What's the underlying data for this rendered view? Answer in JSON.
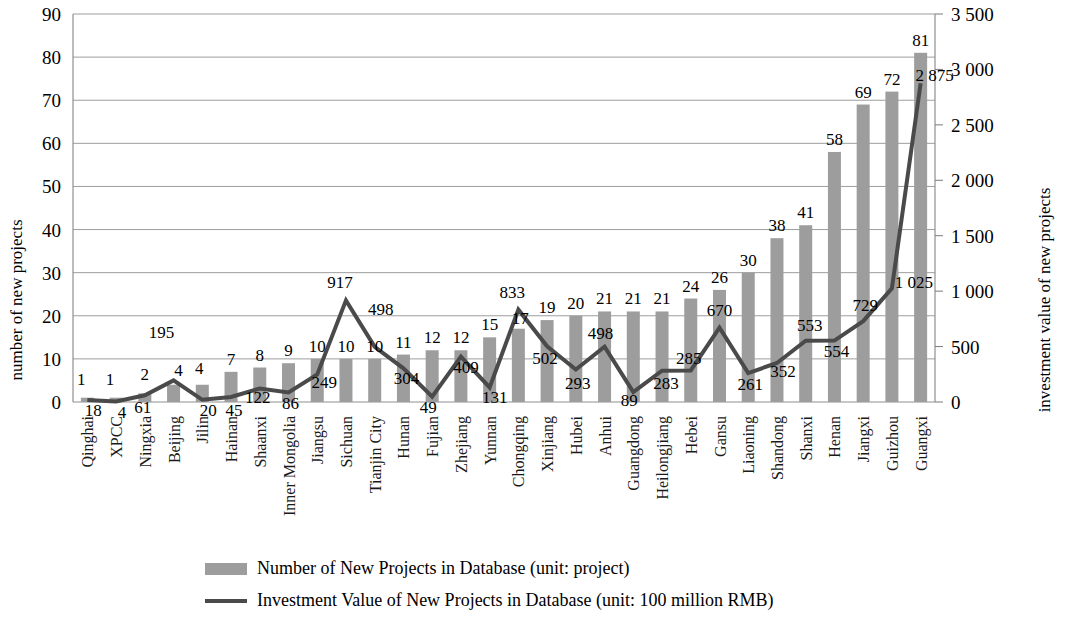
{
  "chart_data": {
    "type": "bar",
    "title": "",
    "subtitle": "",
    "xlabel": "",
    "ylabel": "number of new projects",
    "y2label": "investment value of new projects",
    "ylim": [
      0,
      90
    ],
    "y2lim": [
      0,
      3500
    ],
    "yticks": [
      "0",
      "10",
      "20",
      "30",
      "40",
      "50",
      "60",
      "70",
      "80",
      "90"
    ],
    "ytick_values": [
      0,
      10,
      20,
      30,
      40,
      50,
      60,
      70,
      80,
      90
    ],
    "y2ticks": [
      "0",
      "500",
      "1 000",
      "1 500",
      "2 000",
      "2 500",
      "3 000",
      "3 500"
    ],
    "y2tick_values": [
      0,
      500,
      1000,
      1500,
      2000,
      2500,
      3000,
      3500
    ],
    "grid": true,
    "legend_position": "bottom",
    "categories": [
      "Qinghai",
      "XPCC",
      "Ningxia",
      "Beijing",
      "Jilin",
      "Hainan",
      "Shaanxi",
      "Inner Mongolia",
      "Jiangsu",
      "Sichuan",
      "Tianjin City",
      "Hunan",
      "Fujian",
      "Zhejiang",
      "Yunnan",
      "Chongqing",
      "Xinjiang",
      "Hubei",
      "Anhui",
      "Guangdong",
      "Heilongjiang",
      "Hebei",
      "Gansu",
      "Liaoning",
      "Shandong",
      "Shanxi",
      "Henan",
      "Jiangxi",
      "Guizhou",
      "Guangxi"
    ],
    "series": [
      {
        "name": "Number of New Projects in Database (unit: project)",
        "type": "bar",
        "axis": "left",
        "color": "#9d9d9d",
        "values": [
          1,
          1,
          2,
          4,
          4,
          7,
          8,
          9,
          10,
          10,
          10,
          11,
          12,
          12,
          15,
          17,
          19,
          20,
          21,
          21,
          21,
          24,
          26,
          30,
          38,
          41,
          58,
          69,
          72,
          81
        ],
        "labels": [
          "1",
          "1",
          "2",
          "4",
          "4",
          "7",
          "8",
          "9",
          "10",
          "10",
          "10",
          "11",
          "12",
          "12",
          "15",
          "17",
          "19",
          "20",
          "21",
          "21",
          "21",
          "24",
          "26",
          "30",
          "38",
          "41",
          "58",
          "69",
          "72",
          "81"
        ]
      },
      {
        "name": "Investment Value of New Projects in Database (unit: 100 million RMB)",
        "type": "line",
        "axis": "right",
        "color": "#4a4a4a",
        "values": [
          18,
          4,
          61,
          195,
          20,
          45,
          122,
          86,
          249,
          917,
          498,
          304,
          49,
          409,
          131,
          833,
          502,
          293,
          498,
          89,
          283,
          285,
          670,
          261,
          352,
          553,
          554,
          729,
          1025,
          2875
        ],
        "labels": [
          "18",
          "4",
          "61",
          "195",
          "20",
          "45",
          "122",
          "86",
          "249",
          "917",
          "498",
          "304",
          "49",
          "409",
          "131",
          "833",
          "502",
          "293",
          "498",
          "89",
          "283",
          "285",
          "670",
          "261",
          "352",
          "553",
          "554",
          "729",
          "1 025",
          "2 875"
        ]
      }
    ],
    "legend": [
      {
        "label": "Number of New Projects in Database (unit: project)",
        "marker": "bar-swatch",
        "color": "#9d9d9d"
      },
      {
        "label": "Investment Value of New Projects in Database (unit: 100 million RMB)",
        "marker": "line-swatch",
        "color": "#4a4a4a"
      }
    ]
  }
}
